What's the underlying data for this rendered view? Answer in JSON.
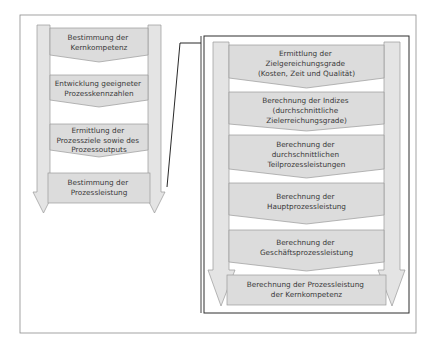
{
  "colors": {
    "step_fill": "#dcdcdc",
    "column_fill": "#e4e4e4",
    "stroke": "#9a9a9a",
    "frame": "#8c8c8c",
    "inner_frame": "#2e2e2e",
    "connector": "#111111",
    "text": "#3a3a3a"
  },
  "overview": {
    "steps": [
      {
        "lines": [
          "Bestimmung der",
          "Kernkompetenz"
        ]
      },
      {
        "lines": [
          "Entwicklung geeigneter",
          "Prozesskennzahlen"
        ]
      },
      {
        "lines": [
          "Ermittlung der",
          "Prozessziele sowie des",
          "Prozessoutputs"
        ]
      },
      {
        "lines": [
          "Bestimmung der",
          "Prozessleistung"
        ]
      }
    ]
  },
  "detail": {
    "steps": [
      {
        "lines": [
          "Ermittlung der",
          "Zielgereichungsgrade",
          "(Kosten, Zeit und Qualität)"
        ]
      },
      {
        "lines": [
          "Berechnung der Indizes",
          "(durchschnittliche",
          "Zielerreichungsgrade)"
        ]
      },
      {
        "lines": [
          "Berechnung der",
          "durchschnittlichen",
          "Teilprozessleistungen"
        ]
      },
      {
        "lines": [
          "Berechnung der",
          "Hauptprozessleistung"
        ]
      },
      {
        "lines": [
          "Berechnung der",
          "Geschäftsprozessleistung"
        ]
      },
      {
        "lines": [
          "Berechnung der Prozessleistung",
          "der Kernkompetenz"
        ]
      }
    ]
  }
}
